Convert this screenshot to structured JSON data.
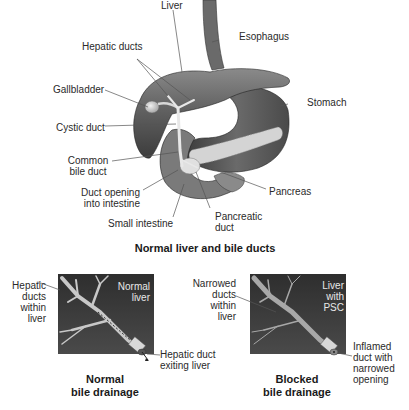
{
  "main_diagram": {
    "title": "Normal liver and bile ducts",
    "labels": {
      "liver": "Liver",
      "esophagus": "Esophagus",
      "hepatic_ducts": "Hepatic ducts",
      "gallbladder": "Gallbladder",
      "stomach": "Stomach",
      "cystic_duct": "Cystic duct",
      "common_bile_duct_1": "Common",
      "common_bile_duct_2": "bile duct",
      "duct_opening_1": "Duct opening",
      "duct_opening_2": "into intestine",
      "pancreas": "Pancreas",
      "small_intestine": "Small intestine",
      "pancreatic_duct_1": "Pancreatic",
      "pancreatic_duct_2": "duct"
    }
  },
  "normal_panel": {
    "inset_label_1": "Normal",
    "inset_label_2": "liver",
    "left_label": [
      "Hepatic",
      "ducts",
      "within",
      "liver"
    ],
    "exit_label_1": "Hepatic duct",
    "exit_label_2": "exiting liver",
    "caption_1": "Normal",
    "caption_2": "bile drainage"
  },
  "blocked_panel": {
    "inset_label_1": "Liver",
    "inset_label_2": "with",
    "inset_label_3": "PSC",
    "left_label": [
      "Narrowed",
      "ducts",
      "within",
      "liver"
    ],
    "right_label": [
      "Inflamed",
      "duct with",
      "narrowed",
      "opening"
    ],
    "caption_1": "Blocked",
    "caption_2": "bile drainage"
  },
  "colors": {
    "organ_dark": "#4a4a4a",
    "organ_mid": "#7a7a7a",
    "organ_light": "#b8b8b8",
    "inset_bg": "#3a3a3a",
    "duct": "#c8c8c8"
  }
}
